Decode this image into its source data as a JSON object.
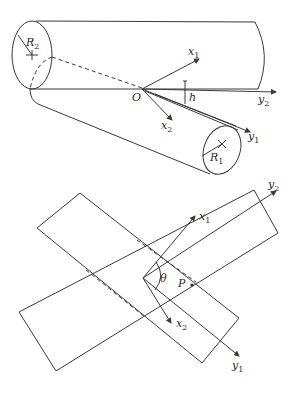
{
  "figure": {
    "top": {
      "description": "Two crossed cylinders with separation h",
      "labels": {
        "R2": {
          "main": "R",
          "sub": "2"
        },
        "R1": {
          "main": "R",
          "sub": "1"
        },
        "O": "O",
        "h": "h",
        "x1": {
          "main": "x",
          "sub": "1"
        },
        "x2": {
          "main": "x",
          "sub": "2"
        },
        "y1": {
          "main": "y",
          "sub": "1"
        },
        "y2": {
          "main": "y",
          "sub": "2"
        }
      }
    },
    "bottom": {
      "description": "Plan view of crossed cylinders at angle theta",
      "labels": {
        "theta": "θ",
        "P": "P",
        "x1": {
          "main": "x",
          "sub": "1"
        },
        "x2": {
          "main": "x",
          "sub": "2"
        },
        "y1": {
          "main": "y",
          "sub": "1"
        },
        "y2": {
          "main": "y",
          "sub": "2"
        }
      }
    }
  }
}
